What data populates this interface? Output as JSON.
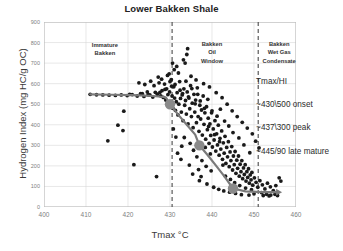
{
  "chart_data": {
    "type": "scatter",
    "title": "Lower Bakken Shale",
    "xlabel": "Tmax °C",
    "ylabel": "Hydrogen Index (mg HC/g OC)",
    "xlim": [
      400,
      460
    ],
    "ylim": [
      0,
      900
    ],
    "xticks": [
      400,
      410,
      420,
      430,
      440,
      450,
      460
    ],
    "yticks": [
      0,
      100,
      200,
      300,
      400,
      500,
      600,
      700,
      800,
      900
    ],
    "grid": true,
    "legend": "none",
    "marker_color": "#1a1a1a",
    "trend_color": "#7a7a7a",
    "points": [
      [
        411.0,
        548
      ],
      [
        412.5,
        546
      ],
      [
        414.0,
        545
      ],
      [
        415.5,
        544
      ],
      [
        417.0,
        543
      ],
      [
        418.4,
        545
      ],
      [
        419.8,
        542
      ],
      [
        421.0,
        547
      ],
      [
        422.2,
        540
      ],
      [
        423.0,
        552
      ],
      [
        423.8,
        538
      ],
      [
        424.6,
        560
      ],
      [
        425.2,
        545
      ],
      [
        425.9,
        535
      ],
      [
        426.5,
        558
      ],
      [
        427.0,
        549
      ],
      [
        427.4,
        604
      ],
      [
        427.8,
        541
      ],
      [
        428.1,
        566
      ],
      [
        428.4,
        533
      ],
      [
        428.7,
        598
      ],
      [
        429.0,
        520
      ],
      [
        429.2,
        575
      ],
      [
        429.5,
        547
      ],
      [
        429.7,
        508
      ],
      [
        429.9,
        560
      ],
      [
        430.1,
        495
      ],
      [
        430.3,
        620
      ],
      [
        430.5,
        540
      ],
      [
        430.7,
        480
      ],
      [
        430.9,
        585
      ],
      [
        431.1,
        530
      ],
      [
        431.3,
        470
      ],
      [
        431.5,
        512
      ],
      [
        431.7,
        556
      ],
      [
        431.9,
        448
      ],
      [
        432.1,
        500
      ],
      [
        432.3,
        610
      ],
      [
        432.5,
        528
      ],
      [
        432.7,
        462
      ],
      [
        432.9,
        545
      ],
      [
        433.1,
        420
      ],
      [
        433.3,
        575
      ],
      [
        433.5,
        495
      ],
      [
        433.7,
        518
      ],
      [
        433.9,
        452
      ],
      [
        434.1,
        560
      ],
      [
        434.3,
        404
      ],
      [
        434.5,
        530
      ],
      [
        434.7,
        478
      ],
      [
        434.9,
        590
      ],
      [
        435.1,
        440
      ],
      [
        435.3,
        505
      ],
      [
        435.5,
        386
      ],
      [
        435.7,
        548
      ],
      [
        435.9,
        462
      ],
      [
        436.1,
        520
      ],
      [
        436.3,
        410
      ],
      [
        436.5,
        580
      ],
      [
        436.7,
        440
      ],
      [
        436.9,
        368
      ],
      [
        437.1,
        495
      ],
      [
        437.3,
        428
      ],
      [
        437.5,
        472
      ],
      [
        437.7,
        350
      ],
      [
        437.9,
        540
      ],
      [
        438.1,
        402
      ],
      [
        438.3,
        458
      ],
      [
        438.5,
        330
      ],
      [
        438.7,
        488
      ],
      [
        438.9,
        376
      ],
      [
        439.1,
        432
      ],
      [
        439.3,
        310
      ],
      [
        439.5,
        404
      ],
      [
        439.7,
        348
      ],
      [
        439.9,
        458
      ],
      [
        440.1,
        292
      ],
      [
        440.3,
        380
      ],
      [
        440.5,
        326
      ],
      [
        440.7,
        420
      ],
      [
        440.9,
        272
      ],
      [
        441.1,
        356
      ],
      [
        441.3,
        302
      ],
      [
        441.5,
        398
      ],
      [
        441.7,
        252
      ],
      [
        441.9,
        334
      ],
      [
        442.1,
        282
      ],
      [
        442.3,
        370
      ],
      [
        442.5,
        232
      ],
      [
        442.7,
        312
      ],
      [
        442.9,
        262
      ],
      [
        443.1,
        344
      ],
      [
        443.3,
        212
      ],
      [
        443.5,
        290
      ],
      [
        443.7,
        244
      ],
      [
        443.9,
        318
      ],
      [
        444.1,
        196
      ],
      [
        444.3,
        268
      ],
      [
        444.5,
        226
      ],
      [
        444.7,
        294
      ],
      [
        444.9,
        180
      ],
      [
        445.1,
        248
      ],
      [
        445.3,
        206
      ],
      [
        445.5,
        270
      ],
      [
        445.7,
        164
      ],
      [
        445.9,
        228
      ],
      [
        446.1,
        188
      ],
      [
        446.3,
        248
      ],
      [
        446.5,
        150
      ],
      [
        446.7,
        208
      ],
      [
        446.9,
        172
      ],
      [
        447.1,
        226
      ],
      [
        447.3,
        138
      ],
      [
        447.5,
        190
      ],
      [
        447.7,
        158
      ],
      [
        447.9,
        206
      ],
      [
        448.1,
        126
      ],
      [
        448.3,
        172
      ],
      [
        448.5,
        144
      ],
      [
        448.7,
        186
      ],
      [
        448.9,
        116
      ],
      [
        449.1,
        156
      ],
      [
        449.3,
        132
      ],
      [
        449.5,
        168
      ],
      [
        449.7,
        106
      ],
      [
        450.1,
        142
      ],
      [
        450.5,
        120
      ],
      [
        450.9,
        96
      ],
      [
        451.4,
        128
      ],
      [
        452.0,
        108
      ],
      [
        452.6,
        88
      ],
      [
        453.2,
        116
      ],
      [
        453.9,
        98
      ],
      [
        454.6,
        80
      ],
      [
        455.2,
        104
      ],
      [
        434.2,
        770
      ],
      [
        434.0,
        742
      ],
      [
        433.2,
        716
      ],
      [
        433.6,
        700
      ],
      [
        430.6,
        700
      ],
      [
        431.0,
        668
      ],
      [
        429.4,
        640
      ],
      [
        427.2,
        632
      ],
      [
        425.4,
        612
      ],
      [
        424.0,
        596
      ],
      [
        422.6,
        604
      ],
      [
        419.0,
        466
      ],
      [
        417.6,
        398
      ],
      [
        418.8,
        372
      ],
      [
        415.2,
        322
      ],
      [
        421.4,
        206
      ],
      [
        426.8,
        148
      ],
      [
        432.0,
        652
      ],
      [
        435.0,
        636
      ],
      [
        436.2,
        618
      ],
      [
        438.0,
        600
      ],
      [
        439.4,
        584
      ],
      [
        441.0,
        556
      ],
      [
        442.4,
        532
      ],
      [
        443.6,
        500
      ],
      [
        444.8,
        468
      ],
      [
        446.0,
        440
      ],
      [
        447.2,
        412
      ],
      [
        448.4,
        384
      ],
      [
        449.6,
        356
      ],
      [
        450.4,
        320
      ],
      [
        451.2,
        288
      ],
      [
        428.0,
        622
      ],
      [
        429.8,
        648
      ],
      [
        431.6,
        684
      ],
      [
        430.0,
        610
      ],
      [
        430.4,
        588
      ],
      [
        431.2,
        596
      ],
      [
        432.4,
        568
      ],
      [
        433.0,
        552
      ],
      [
        433.8,
        612
      ],
      [
        434.4,
        536
      ],
      [
        435.2,
        576
      ],
      [
        436.0,
        502
      ],
      [
        436.6,
        548
      ],
      [
        437.2,
        516
      ],
      [
        438.2,
        480
      ],
      [
        439.0,
        524
      ],
      [
        440.0,
        468
      ],
      [
        441.2,
        442
      ],
      [
        442.0,
        476
      ],
      [
        443.0,
        418
      ],
      [
        444.0,
        394
      ],
      [
        445.0,
        362
      ],
      [
        446.4,
        336
      ],
      [
        447.6,
        302
      ],
      [
        449.0,
        264
      ],
      [
        433.4,
        338
      ],
      [
        434.8,
        310
      ],
      [
        435.6,
        276
      ],
      [
        436.4,
        244
      ],
      [
        437.6,
        226
      ],
      [
        438.6,
        198
      ],
      [
        439.8,
        176
      ],
      [
        432.8,
        296
      ],
      [
        431.4,
        340
      ],
      [
        430.8,
        380
      ],
      [
        437.0,
        128
      ],
      [
        438.8,
        112
      ],
      [
        440.4,
        96
      ],
      [
        441.6,
        86
      ],
      [
        442.8,
        78
      ],
      [
        444.2,
        72
      ],
      [
        445.6,
        66
      ],
      [
        447.0,
        60
      ],
      [
        448.8,
        58
      ],
      [
        450.0,
        64
      ],
      [
        451.8,
        70
      ],
      [
        453.0,
        62
      ],
      [
        454.0,
        58
      ],
      [
        455.0,
        62
      ],
      [
        426.2,
        590
      ],
      [
        427.6,
        558
      ],
      [
        428.8,
        572
      ],
      [
        420.4,
        548
      ],
      [
        423.4,
        552
      ],
      [
        424.8,
        546
      ],
      [
        439.2,
        392
      ],
      [
        440.6,
        352
      ],
      [
        441.8,
        318
      ],
      [
        443.2,
        150
      ],
      [
        444.4,
        134
      ],
      [
        445.4,
        118
      ],
      [
        446.6,
        104
      ],
      [
        448.0,
        92
      ],
      [
        449.4,
        84
      ],
      [
        456.0,
        142
      ],
      [
        456.4,
        126
      ],
      [
        434.6,
        204
      ],
      [
        436.8,
        182
      ],
      [
        432.6,
        232
      ],
      [
        431.8,
        262
      ],
      [
        435.4,
        160
      ],
      [
        437.4,
        148
      ],
      [
        438.4,
        290
      ],
      [
        439.6,
        258
      ],
      [
        442.6,
        204
      ],
      [
        452.2,
        56
      ],
      [
        453.6,
        54
      ],
      [
        455.6,
        56
      ]
    ],
    "trend_line": [
      [
        411.0,
        548
      ],
      [
        416.0,
        546
      ],
      [
        421.0,
        544
      ],
      [
        426.0,
        540
      ],
      [
        429.0,
        534
      ],
      [
        430.0,
        500
      ],
      [
        432.0,
        448
      ],
      [
        434.0,
        400
      ],
      [
        436.0,
        352
      ],
      [
        437.0,
        300
      ],
      [
        439.0,
        252
      ],
      [
        441.0,
        200
      ],
      [
        443.0,
        148
      ],
      [
        445.0,
        90
      ],
      [
        448.0,
        76
      ],
      [
        452.0,
        72
      ],
      [
        455.5,
        72
      ]
    ],
    "trend_markers": [
      {
        "x": 430,
        "y": 500,
        "label": "onset"
      },
      {
        "x": 437,
        "y": 300,
        "label": "peak"
      },
      {
        "x": 445,
        "y": 90,
        "label": "late mature"
      }
    ],
    "vlines": [
      {
        "x": 430.5,
        "style": "dashed"
      },
      {
        "x": 451.0,
        "style": "dashed"
      }
    ],
    "region_labels": [
      {
        "text": [
          "Immature",
          "Bakken"
        ],
        "x": 414.5,
        "y": 810
      },
      {
        "text": [
          "Bakken",
          "Oil",
          "Window"
        ],
        "x": 440.0,
        "y": 812
      },
      {
        "text": [
          "Bakken",
          "Wet Gas",
          "Condensate"
        ],
        "x": 456.0,
        "y": 812
      }
    ],
    "annotations": [
      {
        "text": "Tmax/HI",
        "x": 450.5,
        "y": 605
      },
      {
        "text": "~430\\500 onset",
        "x": 450.5,
        "y": 492
      },
      {
        "text": "~437\\300 peak",
        "x": 450.5,
        "y": 378
      },
      {
        "text": "~445/90 late mature",
        "x": 450.5,
        "y": 264
      }
    ]
  }
}
